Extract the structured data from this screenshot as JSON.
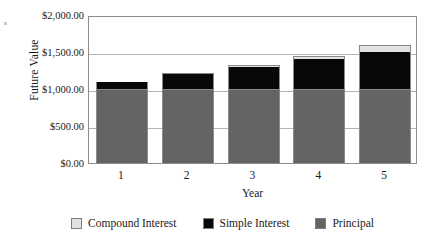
{
  "chart_data": {
    "type": "bar",
    "subtype": "stacked",
    "title": "",
    "xlabel": "Year",
    "ylabel": "Future Value",
    "categories": [
      "1",
      "2",
      "3",
      "4",
      "5"
    ],
    "x_tick_labels": [
      "1",
      "2",
      "3",
      "4",
      "5"
    ],
    "y_tick_labels": [
      "$0.00",
      "$500.00",
      "$1,000.00",
      "$1,500.00",
      "$2,000.00"
    ],
    "y_tick_values": [
      0,
      500,
      1000,
      1500,
      2000
    ],
    "ylim": [
      0,
      2000
    ],
    "grid": true,
    "legend_position": "bottom",
    "series": [
      {
        "name": "Principal",
        "color": "#646464",
        "values": [
          1000,
          1000,
          1000,
          1000,
          1000
        ]
      },
      {
        "name": "Simple Interest",
        "color": "#080808",
        "values": [
          100,
          200,
          300,
          400,
          500
        ]
      },
      {
        "name": "Compound Interest",
        "color": "#e2e2e2",
        "values": [
          0,
          20,
          30,
          40,
          100
        ]
      }
    ],
    "stack_order_bottom_to_top": [
      "Principal",
      "Simple Interest",
      "Compound Interest"
    ],
    "totals": [
      1100,
      1220,
      1330,
      1440,
      1600
    ]
  },
  "axes": {
    "y_title": "Future Value",
    "x_title": "Year"
  },
  "legend": {
    "items": [
      {
        "label": "Compound Interest",
        "color": "#e2e2e2"
      },
      {
        "label": "Simple Interest",
        "color": "#080808"
      },
      {
        "label": "Principal",
        "color": "#646464"
      }
    ]
  }
}
